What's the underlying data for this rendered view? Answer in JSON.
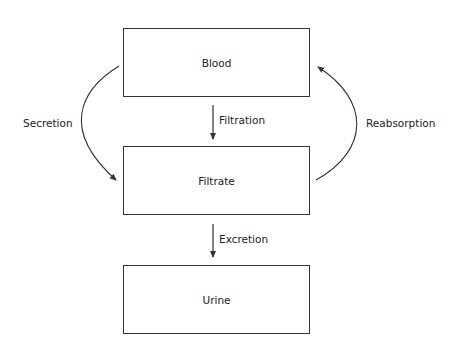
{
  "diagram": {
    "nodes": [
      {
        "id": "blood",
        "label": "Blood"
      },
      {
        "id": "filtrate",
        "label": "Filtrate"
      },
      {
        "id": "urine",
        "label": "Urine"
      }
    ],
    "edges": [
      {
        "from": "blood",
        "to": "filtrate",
        "label": "Filtration"
      },
      {
        "from": "filtrate",
        "to": "urine",
        "label": "Excretion"
      },
      {
        "from": "blood",
        "to": "filtrate",
        "label": "Secretion"
      },
      {
        "from": "filtrate",
        "to": "blood",
        "label": "Reabsorption"
      }
    ],
    "colors": {
      "stroke": "#333333",
      "text": "#222222",
      "background": "#ffffff"
    }
  }
}
